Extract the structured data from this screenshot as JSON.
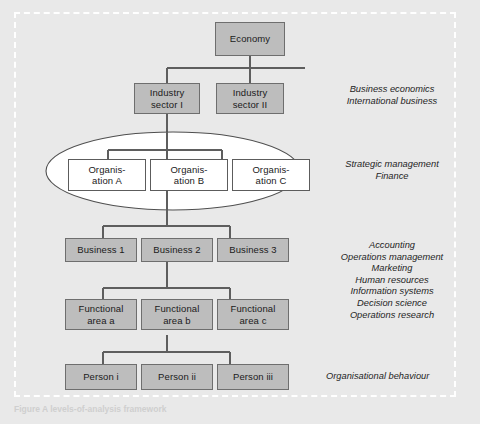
{
  "figure": {
    "background_color": "#e9e9e9",
    "frame_color": "#ffffff",
    "box_fill": "#bdbdbd",
    "box_border": "#6e6e6e",
    "white_box_fill": "#ffffff",
    "line_color": "#5e5e5e",
    "caption": "Figure  A levels-of-analysis framework"
  },
  "nodes": {
    "economy": "Economy",
    "industry_sector_1": "Industry\nsector I",
    "industry_sector_2": "Industry\nsector II",
    "organisation_a": "Organis-\nation A",
    "organisation_b": "Organis-\nation B",
    "organisation_c": "Organis-\nation C",
    "business_1": "Business 1",
    "business_2": "Business 2",
    "business_3": "Business 3",
    "functional_area_a": "Functional\narea a",
    "functional_area_b": "Functional\narea b",
    "functional_area_c": "Functional\narea c",
    "person_i": "Person i",
    "person_ii": "Person ii",
    "person_iii": "Person iii"
  },
  "annotations": {
    "industry_level": "Business economics\nInternational business",
    "organisation_level": "Strategic management\nFinance",
    "business_function_level": "Accounting\nOperations management\nMarketing\nHuman resources\nInformation systems\nDecision science\nOperations research",
    "person_level": "Organisational behaviour"
  }
}
